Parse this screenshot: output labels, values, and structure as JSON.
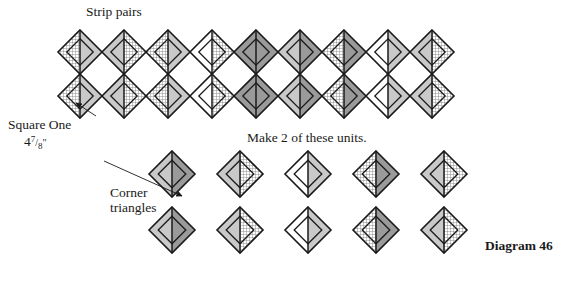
{
  "diagram": {
    "title_label": "Strip pairs",
    "square_one_label": "Square One",
    "square_one_size": "4⁷/₈\"",
    "make_units_label": "Make 2 of these units.",
    "corner_label_line1": "Corner",
    "corner_label_line2": "triangles",
    "diagram_number": "Diagram 46"
  },
  "colors": {
    "outline": "#1a1a1a",
    "light_gray": "#c9c9c9",
    "pale_gray": "#e2e2e2",
    "dark_gray": "#9a9a9a",
    "white": "#ffffff",
    "hatch_fg": "#8a8a8a",
    "background": "#ffffff"
  },
  "chart_data": {
    "type": "diagram",
    "title": "Diagram 46",
    "strip": {
      "label": "Strip pairs",
      "columns": 9,
      "rows_per_column": 2,
      "unit_width": 44,
      "unit_height": 44,
      "origin_x": 58,
      "origin_y": 30,
      "note": "Make 2 of these units.",
      "cells": [
        {
          "col": 0,
          "row": 0,
          "left": "hatch",
          "right": "light"
        },
        {
          "col": 0,
          "row": 1,
          "left": "hatch",
          "right": "light"
        },
        {
          "col": 1,
          "row": 0,
          "left": "light",
          "right": "hatch"
        },
        {
          "col": 1,
          "row": 1,
          "left": "light",
          "right": "hatch"
        },
        {
          "col": 2,
          "row": 0,
          "left": "hatch",
          "right": "light"
        },
        {
          "col": 2,
          "row": 1,
          "left": "hatch",
          "right": "light"
        },
        {
          "col": 3,
          "row": 0,
          "left": "white",
          "right": "hatch"
        },
        {
          "col": 3,
          "row": 1,
          "left": "white",
          "right": "hatch"
        },
        {
          "col": 4,
          "row": 0,
          "left": "dark",
          "right": "dark"
        },
        {
          "col": 4,
          "row": 1,
          "left": "dark",
          "right": "dark"
        },
        {
          "col": 5,
          "row": 0,
          "left": "light",
          "right": "dark"
        },
        {
          "col": 5,
          "row": 1,
          "left": "light",
          "right": "dark"
        },
        {
          "col": 6,
          "row": 0,
          "left": "hatch",
          "right": "dark"
        },
        {
          "col": 6,
          "row": 1,
          "left": "hatch",
          "right": "dark"
        },
        {
          "col": 7,
          "row": 0,
          "left": "white",
          "right": "light"
        },
        {
          "col": 7,
          "row": 1,
          "left": "white",
          "right": "light"
        },
        {
          "col": 8,
          "row": 0,
          "left": "light",
          "right": "hatch"
        },
        {
          "col": 8,
          "row": 1,
          "left": "light",
          "right": "hatch"
        }
      ]
    },
    "corner_triangles": {
      "label": "Corner triangles",
      "rows": 2,
      "per_row": 5,
      "unit_size": 46,
      "origin_x": 172,
      "origin_y": 174,
      "gap_x": 68,
      "gap_y": 56,
      "cells": [
        {
          "row": 0,
          "index": 0,
          "left": "light",
          "right": "dark"
        },
        {
          "row": 0,
          "index": 1,
          "left": "light",
          "right": "hatch"
        },
        {
          "row": 0,
          "index": 2,
          "left": "white",
          "right": "light"
        },
        {
          "row": 0,
          "index": 3,
          "left": "hatch",
          "right": "dark"
        },
        {
          "row": 0,
          "index": 4,
          "left": "light",
          "right": "hatch"
        },
        {
          "row": 1,
          "index": 0,
          "left": "light",
          "right": "dark"
        },
        {
          "row": 1,
          "index": 1,
          "left": "light",
          "right": "hatch"
        },
        {
          "row": 1,
          "index": 2,
          "left": "white",
          "right": "light"
        },
        {
          "row": 1,
          "index": 3,
          "left": "hatch",
          "right": "dark"
        },
        {
          "row": 1,
          "index": 4,
          "left": "light",
          "right": "hatch"
        }
      ]
    },
    "leader_lines": [
      {
        "name": "square-one-leader",
        "x1": 96,
        "y1": 116,
        "x2": 76,
        "y2": 103,
        "arrow": true
      },
      {
        "name": "corner-triangles-leader",
        "x1": 104,
        "y1": 161,
        "x2": 182,
        "y2": 196,
        "arrow": true
      }
    ]
  }
}
